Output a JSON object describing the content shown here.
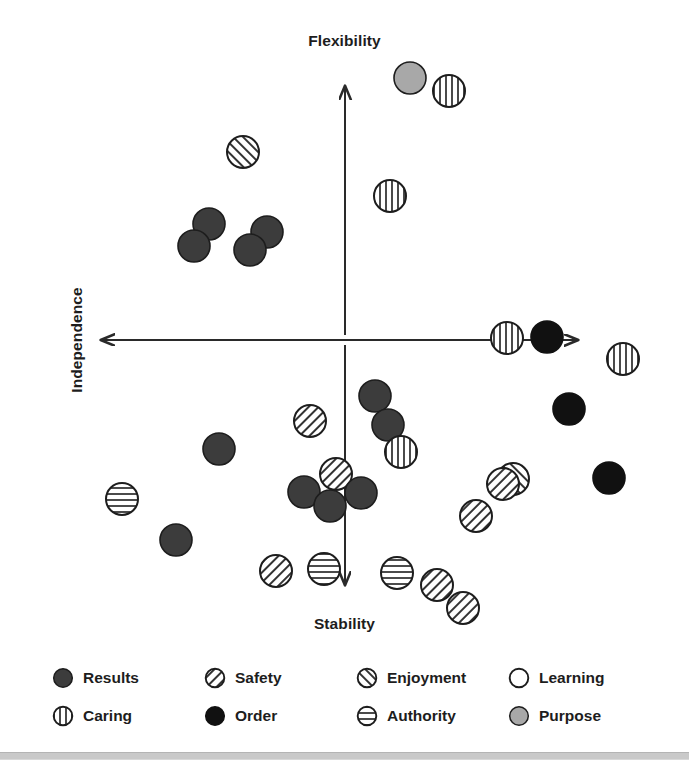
{
  "chart_data": {
    "type": "scatter",
    "title": "",
    "xlabel": "",
    "ylabel": "",
    "axes": {
      "top_label": "Flexibility",
      "bottom_label": "Stability",
      "left_label": "Independence",
      "right_label": "Interdependence",
      "origin": {
        "x": 345,
        "y": 340
      },
      "xlim": [
        -1,
        1
      ],
      "ylim": [
        -1,
        1
      ],
      "grid": false,
      "arrows": "both-ends-both-axes"
    },
    "legend": {
      "position": "bottom",
      "columns": 4,
      "rows": 2,
      "entries": [
        {
          "label": "Results",
          "pattern": "solid",
          "fill": "#3c3c3c",
          "stroke": "#1d1d1d"
        },
        {
          "label": "Safety",
          "pattern": "diagonal-forward",
          "fill": "#ffffff",
          "stroke": "#1d1d1d"
        },
        {
          "label": "Enjoyment",
          "pattern": "diagonal-backward",
          "fill": "#ffffff",
          "stroke": "#1d1d1d"
        },
        {
          "label": "Learning",
          "pattern": "empty",
          "fill": "#ffffff",
          "stroke": "#1d1d1d"
        },
        {
          "label": "Caring",
          "pattern": "vertical",
          "fill": "#ffffff",
          "stroke": "#1d1d1d"
        },
        {
          "label": "Order",
          "pattern": "solid",
          "fill": "#111111",
          "stroke": "#111111"
        },
        {
          "label": "Authority",
          "pattern": "horizontal",
          "fill": "#ffffff",
          "stroke": "#1d1d1d"
        },
        {
          "label": "Purpose",
          "pattern": "solid",
          "fill": "#a8a8a8",
          "stroke": "#1d1d1d"
        }
      ]
    },
    "points": [
      {
        "series": "Purpose",
        "px": 410,
        "py": 78,
        "r": 16
      },
      {
        "series": "Caring",
        "px": 449,
        "py": 91,
        "r": 16
      },
      {
        "series": "Enjoyment",
        "px": 243,
        "py": 152,
        "r": 16
      },
      {
        "series": "Caring",
        "px": 390,
        "py": 196,
        "r": 16
      },
      {
        "series": "Results",
        "px": 209,
        "py": 224,
        "r": 16
      },
      {
        "series": "Results",
        "px": 194,
        "py": 246,
        "r": 16
      },
      {
        "series": "Results",
        "px": 267,
        "py": 232,
        "r": 16
      },
      {
        "series": "Results",
        "px": 250,
        "py": 250,
        "r": 16
      },
      {
        "series": "Caring",
        "px": 507,
        "py": 338,
        "r": 16
      },
      {
        "series": "Order",
        "px": 547,
        "py": 337,
        "r": 16
      },
      {
        "series": "Caring",
        "px": 623,
        "py": 359,
        "r": 16
      },
      {
        "series": "Results",
        "px": 375,
        "py": 396,
        "r": 16
      },
      {
        "series": "Results",
        "px": 388,
        "py": 425,
        "r": 16
      },
      {
        "series": "Order",
        "px": 569,
        "py": 409,
        "r": 16
      },
      {
        "series": "Safety",
        "px": 310,
        "py": 421,
        "r": 16
      },
      {
        "series": "Caring",
        "px": 401,
        "py": 452,
        "r": 16
      },
      {
        "series": "Results",
        "px": 219,
        "py": 449,
        "r": 16
      },
      {
        "series": "Safety",
        "px": 336,
        "py": 474,
        "r": 16
      },
      {
        "series": "Enjoyment",
        "px": 513,
        "py": 479,
        "r": 16
      },
      {
        "series": "Safety",
        "px": 503,
        "py": 484,
        "r": 16
      },
      {
        "series": "Order",
        "px": 609,
        "py": 478,
        "r": 16
      },
      {
        "series": "Results",
        "px": 304,
        "py": 492,
        "r": 16
      },
      {
        "series": "Results",
        "px": 361,
        "py": 493,
        "r": 16
      },
      {
        "series": "Results",
        "px": 330,
        "py": 506,
        "r": 16
      },
      {
        "series": "Authority",
        "px": 122,
        "py": 499,
        "r": 16
      },
      {
        "series": "Safety",
        "px": 476,
        "py": 516,
        "r": 16
      },
      {
        "series": "Results",
        "px": 176,
        "py": 540,
        "r": 16
      },
      {
        "series": "Safety",
        "px": 276,
        "py": 571,
        "r": 16
      },
      {
        "series": "Authority",
        "px": 324,
        "py": 569,
        "r": 16
      },
      {
        "series": "Authority",
        "px": 397,
        "py": 573,
        "r": 16
      },
      {
        "series": "Safety",
        "px": 437,
        "py": 585,
        "r": 16
      },
      {
        "series": "Safety",
        "px": 463,
        "py": 608,
        "r": 16
      }
    ],
    "series_counts": {
      "Results": 11,
      "Safety": 7,
      "Enjoyment": 2,
      "Learning": 0,
      "Caring": 5,
      "Order": 3,
      "Authority": 3,
      "Purpose": 1
    }
  }
}
